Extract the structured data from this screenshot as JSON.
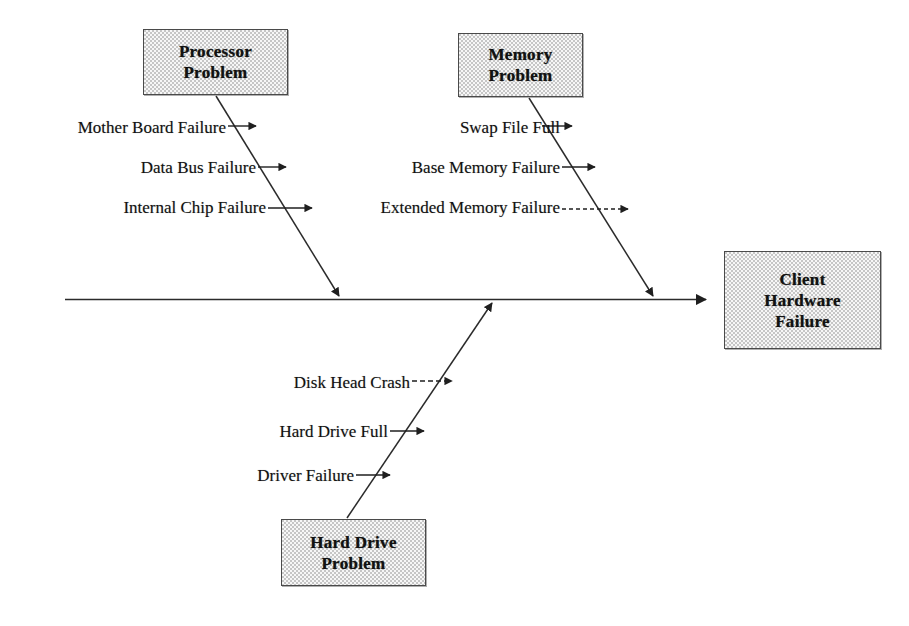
{
  "diagram": {
    "type": "fishbone",
    "effect": {
      "name": "effect-box",
      "lines": [
        "Client",
        "Hardware",
        "Failure"
      ]
    },
    "categories": [
      {
        "id": "processor",
        "lines": [
          "Processor",
          "Problem"
        ],
        "position": "upper-left",
        "causes": [
          "Mother Board Failure",
          "Data Bus Failure",
          "Internal Chip Failure"
        ]
      },
      {
        "id": "memory",
        "lines": [
          "Memory",
          "Problem"
        ],
        "position": "upper-right",
        "causes": [
          "Swap File Full",
          "Base Memory Failure",
          "Extended Memory Failure"
        ]
      },
      {
        "id": "harddrive",
        "lines": [
          "Hard Drive",
          "Problem"
        ],
        "position": "lower-center",
        "causes": [
          "Disk Head Crash",
          "Hard Drive Full",
          "Driver Failure"
        ]
      }
    ],
    "colors": {
      "box_fill": "#c6c6c6",
      "box_border": "#4a4a4a",
      "line": "#2b2b2b",
      "text": "#111111",
      "background": "#ffffff"
    }
  }
}
